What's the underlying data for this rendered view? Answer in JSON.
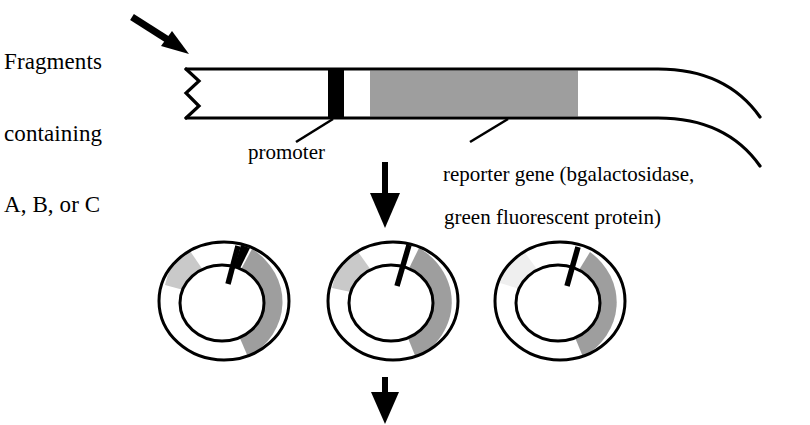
{
  "diagram": {
    "labels": {
      "fragments_line1": "Fragments",
      "fragments_line2": "containing",
      "fragments_line3": "A, B, or C",
      "promoter": "promoter",
      "reporter_line1": "reporter gene (bgalactosidase,",
      "reporter_line2": "green fluorescent protein)"
    },
    "colors": {
      "stroke": "#000000",
      "promoter_fill": "#000000",
      "reporter_fill": "#9e9e9e",
      "plasmid_gray_dark": "#9e9e9e",
      "plasmid_gray_light": "#d8d8d8",
      "plasmid_gray_pale": "#f0f0f0",
      "background": "#ffffff"
    },
    "construct": {
      "name": "dna-fragment-bar",
      "left_end": "zigzag-break",
      "right_end": "flared-open",
      "segments": [
        {
          "name": "upstream-region",
          "fill": "#ffffff"
        },
        {
          "name": "promoter-block",
          "fill": "#000000"
        },
        {
          "name": "spacer-region",
          "fill": "#ffffff"
        },
        {
          "name": "reporter-gene-block",
          "fill": "#9e9e9e"
        },
        {
          "name": "downstream-region",
          "fill": "#ffffff"
        }
      ]
    },
    "plasmids": [
      {
        "name": "plasmid-1",
        "promoter_angle_deg": -75,
        "arcs": [
          "dark-right",
          "light-upper-left"
        ]
      },
      {
        "name": "plasmid-2",
        "promoter_angle_deg": -78,
        "arcs": [
          "dark-right",
          "light-upper-left"
        ]
      },
      {
        "name": "plasmid-3",
        "promoter_angle_deg": -72,
        "arcs": [
          "dark-right",
          "pale-upper-left"
        ]
      }
    ],
    "arrows": [
      {
        "name": "pointer-arrow-to-fragment",
        "direction": "down-right"
      },
      {
        "name": "flow-arrow-construct-to-plasmids",
        "direction": "down"
      },
      {
        "name": "flow-arrow-plasmids-to-next",
        "direction": "down"
      }
    ]
  }
}
